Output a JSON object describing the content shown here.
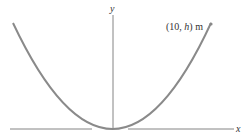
{
  "diagram": {
    "x_axis_label": "x",
    "y_axis_label": "y",
    "point_label_prefix": "(10, ",
    "point_label_var": "h",
    "point_label_suffix": ") m",
    "curve_color": "#8a8a8a",
    "axis_color": "#777777"
  }
}
